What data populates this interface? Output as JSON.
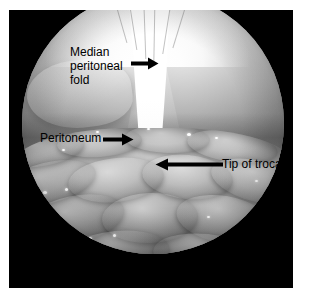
{
  "figure": {
    "kind": "endoscopic-photograph",
    "modality": "laparoscopy",
    "color_mode": "grayscale",
    "frame_background": "#000000",
    "page_background": "#ffffff",
    "annotation_color": "#000000"
  },
  "annotations": [
    {
      "id": "median-peritoneal-fold",
      "lines": [
        "Median",
        "peritoneal",
        "fold"
      ],
      "text": "Median peritoneal fold",
      "arrow_direction": "right",
      "text_x": 70,
      "text_y": 45,
      "arrow_x": 131,
      "arrow_y": 63,
      "arrow_length": 27
    },
    {
      "id": "peritoneum",
      "lines": [
        "Peritoneum"
      ],
      "text": "Peritoneum",
      "arrow_direction": "right",
      "text_x": 40,
      "text_y": 131,
      "arrow_x": 103,
      "arrow_y": 139,
      "arrow_length": 30
    },
    {
      "id": "tip-of-trocar",
      "lines": [
        "Tip of trocar"
      ],
      "text": "Tip of trocar",
      "arrow_direction": "left",
      "text_x": 222,
      "text_y": 156,
      "arrow_x": 155,
      "arrow_y": 164,
      "arrow_length": 67
    }
  ],
  "scene": {
    "structures": [
      "median peritoneal fold",
      "peritoneum",
      "tip of trocar",
      "bowel loops"
    ]
  }
}
